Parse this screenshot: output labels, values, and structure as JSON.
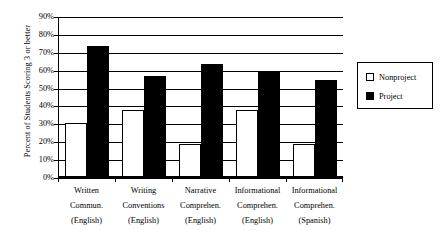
{
  "chart_data": {
    "type": "bar",
    "title": "",
    "subtitle": "",
    "xlabel": "",
    "ylabel": "Percent of Students Scoring 3 or better",
    "ylim": [
      0,
      90
    ],
    "ytick_labels": [
      "90%",
      "80%",
      "70%",
      "60%",
      "50%",
      "40%",
      "30%",
      "20%",
      "10%",
      "0%"
    ],
    "ytick_values": [
      90,
      80,
      70,
      60,
      50,
      40,
      30,
      20,
      10,
      0
    ],
    "grid": true,
    "legend_position": "right",
    "categories": [
      "Written Commun. (English)",
      "Writing Conventions (English)",
      "Narrative Comprehen. (English)",
      "Informational Comprehen. (English)",
      "Informational Comprehen. (Spanish)"
    ],
    "category_lines": [
      [
        "Written",
        "Commun.",
        "(English)"
      ],
      [
        "Writing",
        "Conventions",
        "(English)"
      ],
      [
        "Narrative",
        "Comprehen.",
        "(English)"
      ],
      [
        "Informational",
        "Comprehen.",
        "(English)"
      ],
      [
        "Informational",
        "Comprehen.",
        "(Spanish)"
      ]
    ],
    "series": [
      {
        "name": "Nonproject",
        "color": "#ffffff",
        "edge_color": "#000000",
        "values": [
          31,
          38,
          19,
          38,
          19
        ]
      },
      {
        "name": "Project",
        "color": "#000000",
        "edge_color": "#000000",
        "values": [
          74,
          57,
          64,
          60,
          55
        ]
      }
    ]
  },
  "legend": {
    "items": [
      {
        "label": "Nonproject"
      },
      {
        "label": "Project"
      }
    ]
  }
}
